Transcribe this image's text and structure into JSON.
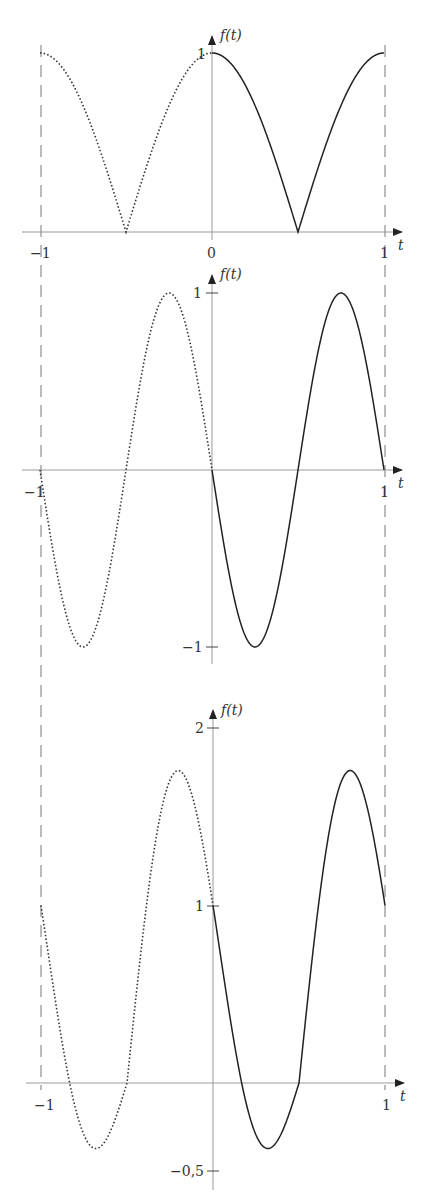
{
  "chart_data": [
    {
      "type": "line",
      "title": "",
      "xlabel": "t",
      "ylabel": "f(t)",
      "xlim": [
        -1,
        1
      ],
      "ylim": [
        0,
        1
      ],
      "x_ticks": [
        {
          "v": -1,
          "label": "−1"
        },
        {
          "v": 0,
          "label": "0"
        },
        {
          "v": 1,
          "label": "1"
        }
      ],
      "y_ticks": [
        {
          "v": 1,
          "label": "1"
        }
      ],
      "grid": false,
      "formula": "|cos(pi t)|",
      "series": [
        {
          "name": "periodic extension (dotted)",
          "style": "dotted",
          "x": [
            -1,
            -0.75,
            -0.5,
            -0.25,
            0
          ],
          "values": [
            1,
            0.707,
            0,
            0.707,
            1
          ]
        },
        {
          "name": "f(t) on [0,1] (solid)",
          "style": "solid",
          "x": [
            0,
            0.25,
            0.5,
            0.75,
            1
          ],
          "values": [
            1,
            0.707,
            0,
            0.707,
            1
          ]
        }
      ]
    },
    {
      "type": "line",
      "title": "",
      "xlabel": "t",
      "ylabel": "f(t)",
      "xlim": [
        -1,
        1
      ],
      "ylim": [
        -1,
        1
      ],
      "x_ticks": [
        {
          "v": -1,
          "label": "−1"
        },
        {
          "v": 1,
          "label": "1"
        }
      ],
      "y_ticks": [
        {
          "v": 1,
          "label": "1"
        },
        {
          "v": -1,
          "label": "−1"
        }
      ],
      "grid": false,
      "formula": "-sin(2 pi t)",
      "series": [
        {
          "name": "periodic extension (dotted)",
          "style": "dotted",
          "x": [
            -1,
            -0.75,
            -0.5,
            -0.25,
            0
          ],
          "values": [
            0,
            -1,
            0,
            1,
            0
          ]
        },
        {
          "name": "f(t) on [0,1] (solid)",
          "style": "solid",
          "x": [
            0,
            0.25,
            0.5,
            0.75,
            1
          ],
          "values": [
            0,
            -1,
            0,
            1,
            0
          ]
        }
      ]
    },
    {
      "type": "line",
      "title": "",
      "xlabel": "t",
      "ylabel": "f(t)",
      "xlim": [
        -1,
        1
      ],
      "ylim": [
        -0.5,
        2
      ],
      "x_ticks": [
        {
          "v": -1,
          "label": "−1"
        },
        {
          "v": 1,
          "label": "1"
        }
      ],
      "y_ticks": [
        {
          "v": 2,
          "label": "2"
        },
        {
          "v": 1,
          "label": "1"
        },
        {
          "v": -0.5,
          "label": "−0,5"
        }
      ],
      "grid": false,
      "formula": "|cos(pi t)| - sin(2 pi t)",
      "series": [
        {
          "name": "periodic extension (dotted)",
          "style": "dotted",
          "x": [
            -1,
            -0.68,
            -0.5,
            -0.2,
            0
          ],
          "values": [
            1,
            -0.37,
            0,
            1.76,
            1
          ]
        },
        {
          "name": "f(t) on [0,1] (solid)",
          "style": "solid",
          "x": [
            0,
            0.25,
            0.32,
            0.5,
            0.8,
            1
          ],
          "values": [
            1,
            -0.29,
            -0.37,
            0,
            1.76,
            1
          ]
        }
      ]
    }
  ],
  "panels": [
    {
      "y_axis_label": "f(t)",
      "x_axis_label": "t"
    },
    {
      "y_axis_label": "f(t)",
      "x_axis_label": "t"
    },
    {
      "y_axis_label": "f(t)",
      "x_axis_label": "t"
    }
  ]
}
